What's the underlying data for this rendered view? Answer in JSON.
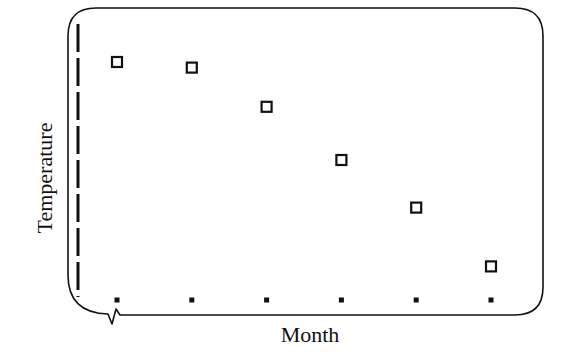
{
  "chart_data": {
    "type": "scatter",
    "title": "",
    "xlabel": "Month",
    "ylabel": "Temperature",
    "categories": [
      "1",
      "2",
      "3",
      "4",
      "5",
      "6"
    ],
    "tick_labels_visible": false,
    "series": [
      {
        "name": "Temperature",
        "marker": "hollow-square",
        "values": [
          85,
          83,
          69,
          50,
          33,
          12
        ]
      }
    ],
    "ylim": [
      0,
      100
    ],
    "grid": false,
    "legend": "none",
    "frame": "rounded-rectangle",
    "annotations": [
      "axis break on x-axis near origin",
      "dashed y-axis line"
    ]
  },
  "colors": {
    "ink": "#111111",
    "background": "#ffffff"
  }
}
